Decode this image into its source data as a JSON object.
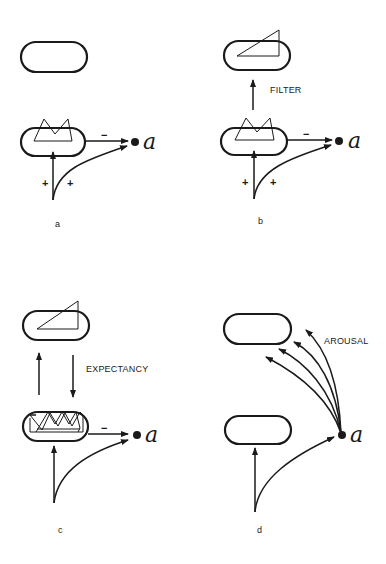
{
  "figure": {
    "panels": [
      {
        "id": "a",
        "label": "a",
        "node_label": "a",
        "minus_sign": "−",
        "plus_left": "+",
        "plus_right": "+"
      },
      {
        "id": "b",
        "label": "b",
        "node_label": "a",
        "minus_sign": "−",
        "plus_left": "+",
        "plus_right": "+",
        "annotation": "FILTER"
      },
      {
        "id": "c",
        "label": "c",
        "node_label": "a",
        "minus_sign": "−",
        "annotation": "EXPECTANCY"
      },
      {
        "id": "d",
        "label": "d",
        "node_label": "a",
        "annotation": "AROUSAL"
      }
    ],
    "colors": {
      "ink": "#1a1a1a",
      "background": "#ffffff"
    }
  }
}
